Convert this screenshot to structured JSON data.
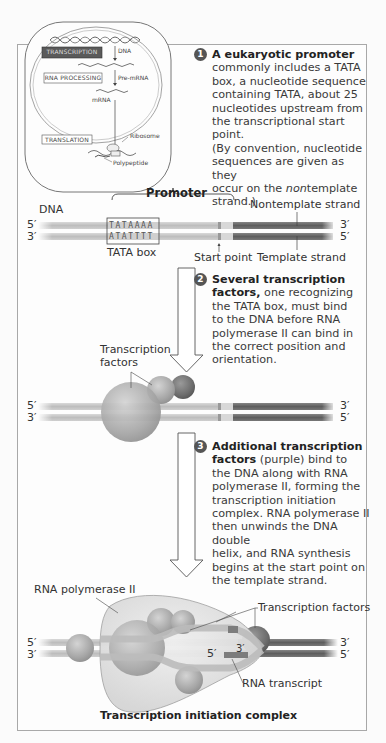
{
  "overview": {
    "labels": {
      "transcription": "TRANSCRIPTION",
      "rna_processing": "RNA PROCESSING",
      "translation": "TRANSLATION",
      "dna": "DNA",
      "pre_mrna": "Pre-mRNA",
      "mrna": "mRNA",
      "ribosome": "Ribosome",
      "polypeptide": "Polypeptide"
    }
  },
  "steps": [
    {
      "number": "1",
      "title": "A eukaryotic promoter",
      "body_lines": [
        "commonly includes a TATA",
        "box, a nucleotide sequence",
        "containing TATA, about 25",
        "nucleotides upstream from",
        "the transcriptional start point.",
        "(By convention, nucleotide",
        "sequences are given as they"
      ],
      "last_line_pre": "occur on the ",
      "last_line_italic": "non",
      "last_line_post": "template",
      "final_line": "strand.)"
    },
    {
      "number": "2",
      "title_line1": "Several transcription",
      "title_line2": "factors,",
      "body_first": " one recognizing",
      "body_lines": [
        "the TATA box, must bind",
        "to the DNA before RNA",
        "polymerase II can bind in",
        "the correct position and",
        "orientation."
      ]
    },
    {
      "number": "3",
      "title_line1": "Additional transcription",
      "title_line2": "factors",
      "body_first": " (purple) bind to",
      "body_lines": [
        "the DNA along with RNA",
        "polymerase II, forming the",
        "transcription initiation",
        "complex. RNA polymerase II",
        "then unwinds the DNA double",
        "helix, and RNA synthesis",
        "begins at the start point on",
        "the template strand."
      ]
    }
  ],
  "panel1": {
    "promoter_label": "Promoter",
    "dna_label": "DNA",
    "nontemplate_label": "Nontemplate strand",
    "template_label": "Template strand",
    "tata_box_label": "TATA box",
    "start_point_label": "Start point",
    "top_seq": "TATAAAA",
    "bottom_seq": "ATATTTT",
    "end_top_left": "5′",
    "end_bottom_left": "3′",
    "end_top_right": "3′",
    "end_bottom_right": "5′"
  },
  "panel2": {
    "tf_label_line1": "Transcription",
    "tf_label_line2": "factors",
    "end_top_left": "5′",
    "end_bottom_left": "3′",
    "end_top_right": "3′",
    "end_bottom_right": "5′"
  },
  "panel3": {
    "rna_pol_label": "RNA polymerase II",
    "tf_label": "Transcription factors",
    "rna_transcript_label": "RNA transcript",
    "transcript_5": "5′",
    "transcript_3": "3′",
    "end_top_left": "5′",
    "end_bottom_left": "3′",
    "end_top_right": "3′",
    "end_bottom_right": "5′",
    "caption": "Transcription initiation complex"
  },
  "colors": {
    "light_strand": "#c6c6c6",
    "promoter_strand": "#d6d6d6",
    "dark_strand": "#6c6c6c",
    "sphere": "#a9a9a9",
    "sphere_dark": "#7a7a7a",
    "polymerase": "#e6e6e6"
  }
}
